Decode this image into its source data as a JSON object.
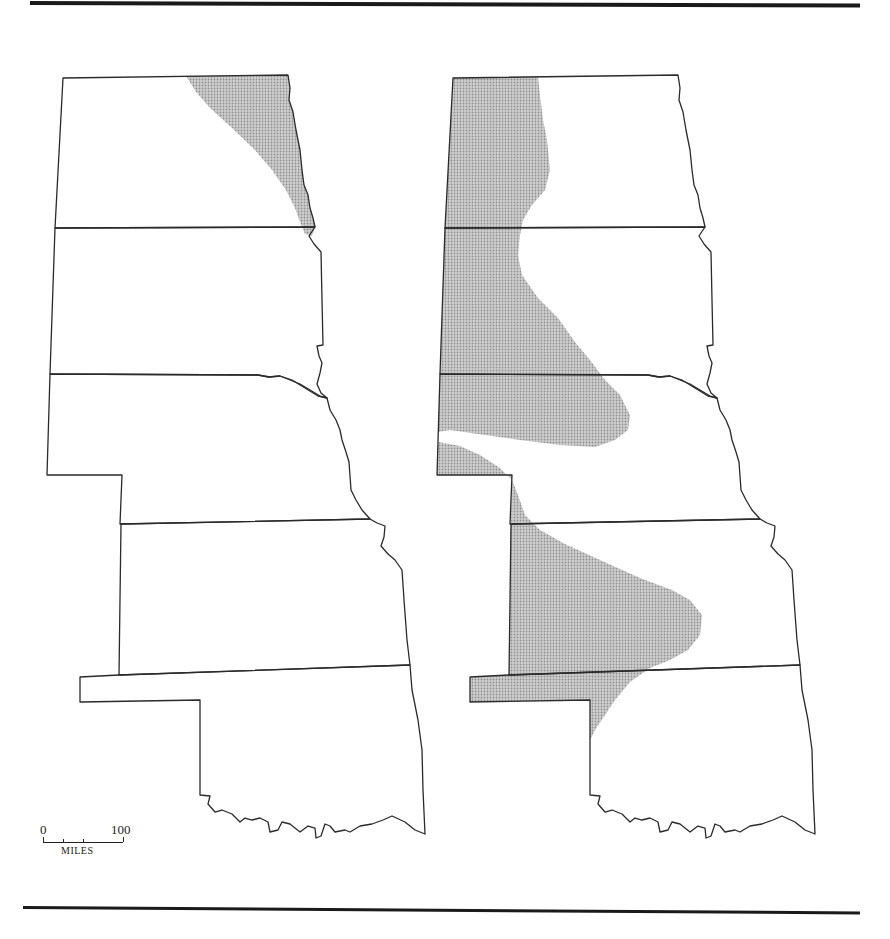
{
  "figure": {
    "title": "",
    "colors": {
      "outline": "#2a2a2a",
      "shading": "#b8b8b8",
      "rules": "#1a1a1a",
      "background": "#ffffff"
    }
  },
  "maps": [
    {
      "id": "left",
      "states": [
        "North Dakota",
        "South Dakota",
        "Nebraska",
        "Kansas",
        "Oklahoma"
      ],
      "shaded_region": "Eastern North Dakota along the Red River, tapering south to the ND–SD border"
    },
    {
      "id": "right",
      "states": [
        "North Dakota",
        "South Dakota",
        "Nebraska",
        "Kansas",
        "Oklahoma"
      ],
      "shaded_region": "Western North and South Dakota extending into northern Nebraska; a second band from southwestern Nebraska through western/central Kansas into the Oklahoma panhandle"
    }
  ],
  "scale_bar": {
    "min_label": "0",
    "max_label": "100",
    "unit_label": "MILES"
  }
}
